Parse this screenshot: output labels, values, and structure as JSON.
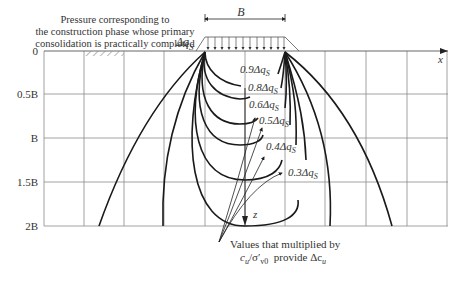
{
  "top_note": {
    "line1": "Pressure corresponding to",
    "line2": "the construction phase whose primary",
    "line3": "consolidation is practically completed"
  },
  "load": {
    "width_label": "B",
    "load_label": "Δq",
    "load_sub": "S"
  },
  "axes": {
    "x_label": "x",
    "z_label": "z",
    "y_ticks": [
      "0",
      "0.5B",
      "B",
      "1.5B",
      "2B"
    ]
  },
  "contours": [
    {
      "label": "0.9Δq",
      "sub": "S"
    },
    {
      "label": "0.8Δq",
      "sub": "S"
    },
    {
      "label": "0.6Δq",
      "sub": "S"
    },
    {
      "label": "0.5Δq",
      "sub": "S"
    },
    {
      "label": "0.4Δq",
      "sub": "S"
    },
    {
      "label": "0.3Δq",
      "sub": "S"
    }
  ],
  "bottom_note": {
    "line1": "Values that multiplied by",
    "line2_a": "c",
    "line2_a_sub": "u",
    "line2_b": "/σ′",
    "line2_b_sub": "v0",
    "line2_c": "  provide Δc",
    "line2_c_sub": "u"
  },
  "colors": {
    "grid": "#8a8a8a",
    "curve": "#1a1a1a",
    "text": "#333333"
  }
}
